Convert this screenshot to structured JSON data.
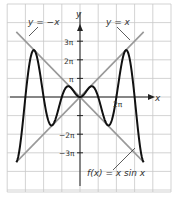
{
  "chart_data": {
    "type": "line",
    "title": "",
    "xlabel": "x",
    "ylabel": "y",
    "x_unit": "pi",
    "xlim": [
      -4,
      5
    ],
    "ylim": [
      -5,
      5
    ],
    "grid": true,
    "y_ticks": [
      {
        "value": 3,
        "label": "3π"
      },
      {
        "value": 2,
        "label": "2π"
      },
      {
        "value": 1,
        "label": "π"
      },
      {
        "value": -2,
        "label": "−2π"
      },
      {
        "value": -3,
        "label": "−3π"
      }
    ],
    "x_ticks": [
      {
        "value": 2,
        "label": "2π"
      }
    ],
    "series": [
      {
        "name": "f(x) = x sin x",
        "label": "f(x) = x sin x",
        "color": "#111111",
        "domain": [
          -3.5,
          3.5
        ],
        "expr": "x sin x"
      },
      {
        "name": "y = x",
        "label": "y = x",
        "color": "#999999",
        "domain": [
          -3.5,
          3.5
        ],
        "expr": "x"
      },
      {
        "name": "y = −x",
        "label": "y = −x",
        "color": "#999999",
        "domain": [
          -3.5,
          3.5
        ],
        "expr": "-x"
      }
    ],
    "annotations": [
      "y = −x",
      "y = x",
      "f(x) = x sin x"
    ]
  },
  "labels": {
    "y_axis": "y",
    "x_axis": "x",
    "neg_line": "y = −x",
    "pos_line": "y = x",
    "func": "f(x) = x sin x",
    "t3": "3π",
    "t2": "2π",
    "t1": "π",
    "tm2": "−2π",
    "tm3": "−3π",
    "tx2": "2π"
  }
}
